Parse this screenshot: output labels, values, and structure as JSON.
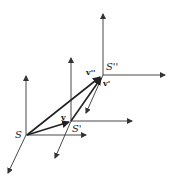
{
  "diagram": {
    "type": "reference-frames-vector-addition",
    "frames": [
      {
        "label": "S",
        "origin": [
          27,
          135
        ]
      },
      {
        "label": "S'",
        "origin": [
          70,
          121
        ]
      },
      {
        "label": "S''",
        "origin": [
          102,
          75
        ]
      }
    ],
    "vectors": [
      {
        "label": "v",
        "from": "S",
        "to": "S'"
      },
      {
        "label": "v'",
        "from": "S'",
        "to": "S''"
      },
      {
        "label": "v''",
        "from": "S",
        "to": "S''"
      }
    ],
    "labels": {
      "s": "S",
      "s_prime": "S'",
      "s_double_prime": "S''",
      "v": "v",
      "v_prime": "v'",
      "v_double_prime": "v''"
    },
    "colors": {
      "line": "#333333",
      "vector": "#222222",
      "background": "#ffffff"
    }
  }
}
